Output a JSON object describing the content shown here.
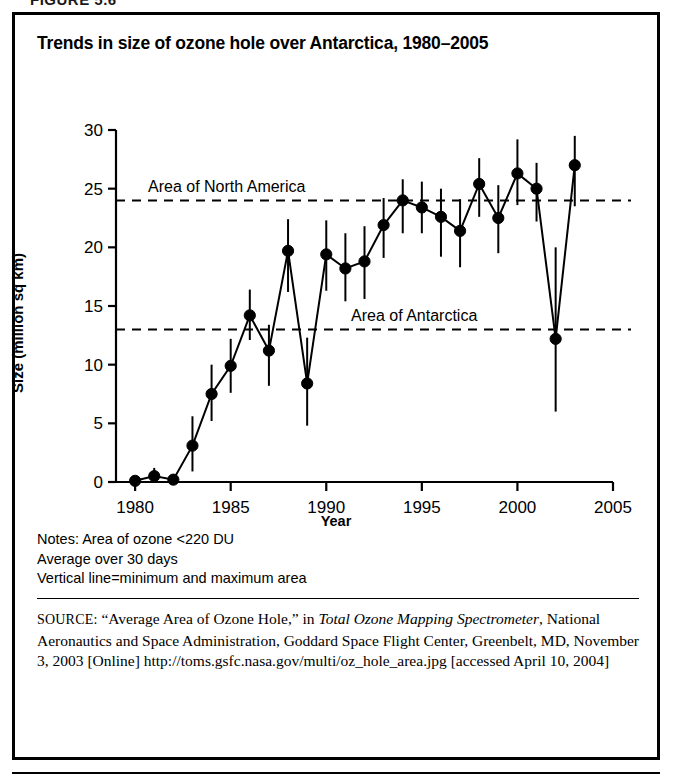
{
  "figure": {
    "caption": "FIGURE 5.6"
  },
  "chart_title": "Trends in size of ozone hole over Antarctica, 1980–2005",
  "axis": {
    "xlabel": "Year",
    "ylabel": "Size (million sq km)"
  },
  "notes": {
    "line1": "Notes: Area of ozone <220 DU",
    "line2": "Average over 30 days",
    "line3": "Vertical line=minimum and maximum area"
  },
  "source": {
    "prefix": "SOURCE:",
    "part1": " “Average Area of Ozone Hole,” in ",
    "italic1": "Total Ozone Mapping Spectrometer",
    "part2": ", National Aeronautics and Space Administration, Goddard Space Flight Center, Greenbelt, MD, November 3, 2003 [Online] http://toms.gsfc.nasa.gov/multi/oz_hole_area.jpg [accessed April 10, 2004]"
  },
  "colors": {
    "line": "#000000",
    "marker": "#000000",
    "reference_line": "#000000",
    "frame": "#000000",
    "background": "#ffffff"
  },
  "chart_data": {
    "type": "line",
    "title": "Trends in size of ozone hole over Antarctica, 1980–2005",
    "xlabel": "Year",
    "ylabel": "Size (million sq km)",
    "xlim": [
      1979,
      2005
    ],
    "ylim": [
      0,
      30
    ],
    "xticks": [
      1980,
      1985,
      1990,
      1995,
      2000,
      2005
    ],
    "yticks": [
      0,
      5,
      10,
      15,
      20,
      25,
      30
    ],
    "grid": false,
    "legend": "none",
    "error_bars": "vertical line = minimum and maximum area",
    "x": [
      1980,
      1981,
      1982,
      1983,
      1984,
      1985,
      1986,
      1987,
      1988,
      1989,
      1990,
      1991,
      1992,
      1993,
      1994,
      1995,
      1996,
      1997,
      1998,
      1999,
      2000,
      2001,
      2002,
      2003
    ],
    "values": [
      0.1,
      0.5,
      0.2,
      3.1,
      7.5,
      9.9,
      14.2,
      11.2,
      19.7,
      8.4,
      19.4,
      18.2,
      18.8,
      21.9,
      24.0,
      23.4,
      22.6,
      21.4,
      25.4,
      22.5,
      26.3,
      25.0,
      12.2,
      27.0
    ],
    "err_low": [
      0.0,
      0.1,
      0.0,
      0.9,
      5.2,
      7.6,
      12.1,
      8.2,
      16.2,
      4.8,
      16.3,
      15.4,
      15.6,
      19.1,
      21.2,
      21.2,
      19.2,
      18.3,
      22.6,
      19.5,
      23.6,
      22.2,
      6.0,
      23.5
    ],
    "err_high": [
      0.4,
      1.2,
      0.5,
      5.6,
      10.0,
      12.2,
      16.4,
      13.4,
      22.4,
      12.3,
      22.3,
      21.2,
      21.8,
      24.2,
      25.8,
      25.6,
      25.0,
      24.1,
      27.6,
      25.3,
      29.2,
      27.2,
      20.0,
      29.5
    ],
    "annotations": [
      {
        "label": "Area of North America",
        "y": 24.0,
        "style": "dashed-horizontal-reference"
      },
      {
        "label": "Area of Antarctica",
        "y": 13.0,
        "style": "dashed-horizontal-reference"
      }
    ]
  }
}
